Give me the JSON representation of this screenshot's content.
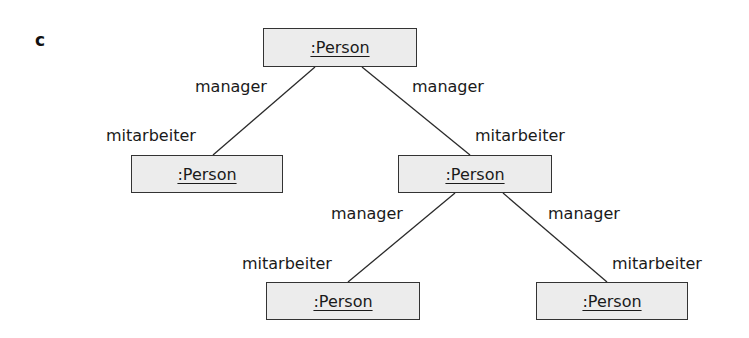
{
  "panel": {
    "label": "c"
  },
  "objects": [
    {
      "id": "root",
      "label": ":Person",
      "x": 263,
      "y": 28,
      "w": 154,
      "h": 39
    },
    {
      "id": "left-mid",
      "label": ":Person",
      "x": 131,
      "y": 155,
      "w": 152,
      "h": 38
    },
    {
      "id": "right-mid",
      "label": ":Person",
      "x": 398,
      "y": 155,
      "w": 154,
      "h": 38
    },
    {
      "id": "bottom-left",
      "label": ":Person",
      "x": 266,
      "y": 282,
      "w": 154,
      "h": 38
    },
    {
      "id": "bottom-right",
      "label": ":Person",
      "x": 536,
      "y": 282,
      "w": 152,
      "h": 38
    }
  ],
  "links": [
    {
      "from": "root",
      "to": "left-mid",
      "x1": 315,
      "y1": 67,
      "x2": 213,
      "y2": 155,
      "manager_label": "manager",
      "mitarbeiter_label": "mitarbeiter"
    },
    {
      "from": "root",
      "to": "right-mid",
      "x1": 362,
      "y1": 67,
      "x2": 470,
      "y2": 155,
      "manager_label": "manager",
      "mitarbeiter_label": "mitarbeiter"
    },
    {
      "from": "right-mid",
      "to": "bottom-left",
      "x1": 455,
      "y1": 193,
      "x2": 348,
      "y2": 282,
      "manager_label": "manager",
      "mitarbeiter_label": "mitarbeiter"
    },
    {
      "from": "right-mid",
      "to": "bottom-right",
      "x1": 503,
      "y1": 193,
      "x2": 607,
      "y2": 282,
      "manager_label": "manager",
      "mitarbeiter_label": "mitarbeiter"
    }
  ],
  "roles": {
    "manager": "manager",
    "mitarbeiter": "mitarbeiter"
  },
  "colors": {
    "box_fill": "#ececec",
    "box_border": "#333333",
    "line": "#2a2a2a",
    "text": "#1a1a1a"
  }
}
